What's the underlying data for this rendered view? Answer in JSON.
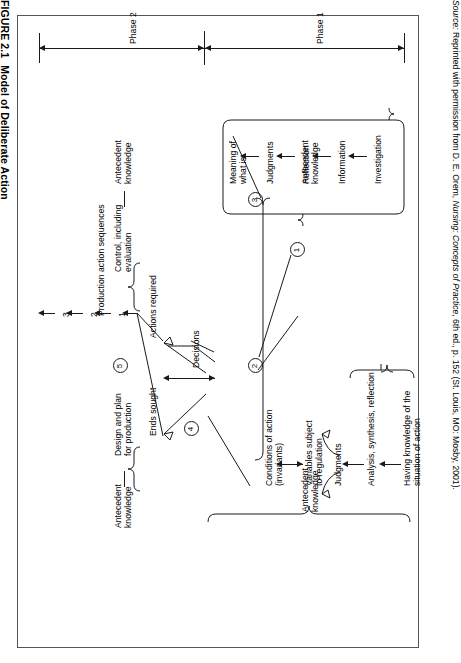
{
  "caption": {
    "label": "FIGURE 2.1",
    "title": "Model of Deliberate Action"
  },
  "source": {
    "prefix": "Source:",
    "text_before_italic": " Reprinted with permission from D. E. Orem, ",
    "italic": "Nursing: Concepts of Practice",
    "text_after_italic": ", 6th ed., p. 152 (St. Louis, MO: Mosby, 2001)."
  },
  "phases": [
    {
      "id": "phase2",
      "label": "Phase 2"
    },
    {
      "id": "phase1",
      "label": "Phase 1"
    }
  ],
  "markers": [
    {
      "id": "marker-1",
      "label": "1"
    },
    {
      "id": "marker-2",
      "label": "2"
    },
    {
      "id": "marker-3",
      "label": "3"
    },
    {
      "id": "marker-4",
      "label": "4"
    },
    {
      "id": "marker-5",
      "label": "5"
    }
  ],
  "step_numbers": [
    {
      "id": "step-1",
      "label": "1"
    },
    {
      "id": "step-2",
      "label": "2"
    },
    {
      "id": "step-3",
      "label": "3"
    }
  ],
  "nodes": {
    "antecedent_knowledge_phase2": "Antecedent\nknowledge",
    "control_including_evaluation": "Control, including\nevaluation",
    "production_action_sequences": "Production action sequences",
    "actions_required": "Actions required",
    "ends_sought": "Ends sought",
    "decisions": "Decisions",
    "antecedent_knowledge_design": "Antecedent\nknowledge",
    "design_and_plan": "Design and plan\nfor production",
    "antecedent_knowledge_phase1_top": "Antecedent\nknowledge",
    "meaning_of_what_is": "Meaning of\nwhat is",
    "judgments_top": "Judgments",
    "reflection": "Reflection",
    "information": "Information",
    "investigation": "Investigation",
    "antecedent_knowledge_phase1_bottom": "Antecedent\nknowledge",
    "conditions_of_action": "Conditions of action\n(invariants)",
    "variables_subject_to_regulation": "Variables subject\nto regulation",
    "judgments_bottom": "Judgments",
    "analysis_synthesis_reflection": "Analysis, synthesis, reflection",
    "having_knowledge_situation": "Having knowledge of the\nsituation of action"
  },
  "colors": {
    "ink": "#1a1a1a",
    "frame": "#555555",
    "background": "#ffffff"
  }
}
